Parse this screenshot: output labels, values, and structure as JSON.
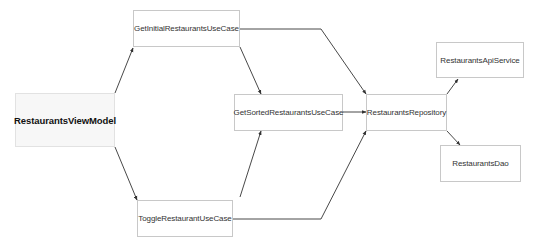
{
  "diagram": {
    "type": "dependency-graph",
    "nodes": {
      "view_model": {
        "label": "RestaurantsViewModel",
        "x": 15,
        "y": 93,
        "w": 100,
        "h": 54
      },
      "get_initial": {
        "label": "GetInitialRestaurantsUseCase",
        "x": 133,
        "y": 10,
        "w": 107,
        "h": 37
      },
      "toggle": {
        "label": "ToggleRestaurantUseCase",
        "x": 137,
        "y": 200,
        "w": 96,
        "h": 37
      },
      "get_sorted": {
        "label": "GetSortedRestaurantsUseCase",
        "x": 234,
        "y": 94,
        "w": 109,
        "h": 37
      },
      "repository": {
        "label": "RestaurantsRepository",
        "x": 366,
        "y": 94,
        "w": 81,
        "h": 37
      },
      "api_service": {
        "label": "RestaurantsApiService",
        "x": 436,
        "y": 42,
        "w": 88,
        "h": 36
      },
      "dao": {
        "label": "RestaurantsDao",
        "x": 440,
        "y": 145,
        "w": 81,
        "h": 37
      }
    },
    "edges": [
      {
        "from": "RestaurantsViewModel",
        "to": "GetInitialRestaurantsUseCase"
      },
      {
        "from": "RestaurantsViewModel",
        "to": "ToggleRestaurantUseCase"
      },
      {
        "from": "GetInitialRestaurantsUseCase",
        "to": "GetSortedRestaurantsUseCase"
      },
      {
        "from": "GetInitialRestaurantsUseCase",
        "to": "RestaurantsRepository"
      },
      {
        "from": "ToggleRestaurantUseCase",
        "to": "GetSortedRestaurantsUseCase"
      },
      {
        "from": "ToggleRestaurantUseCase",
        "to": "RestaurantsRepository"
      },
      {
        "from": "GetSortedRestaurantsUseCase",
        "to": "RestaurantsRepository"
      },
      {
        "from": "RestaurantsRepository",
        "to": "RestaurantsApiService"
      },
      {
        "from": "RestaurantsRepository",
        "to": "RestaurantsDao"
      }
    ],
    "colors": {
      "edge": "#333333",
      "node_border": "#c8c8c8",
      "primary_fill": "#f7f7f7"
    }
  }
}
